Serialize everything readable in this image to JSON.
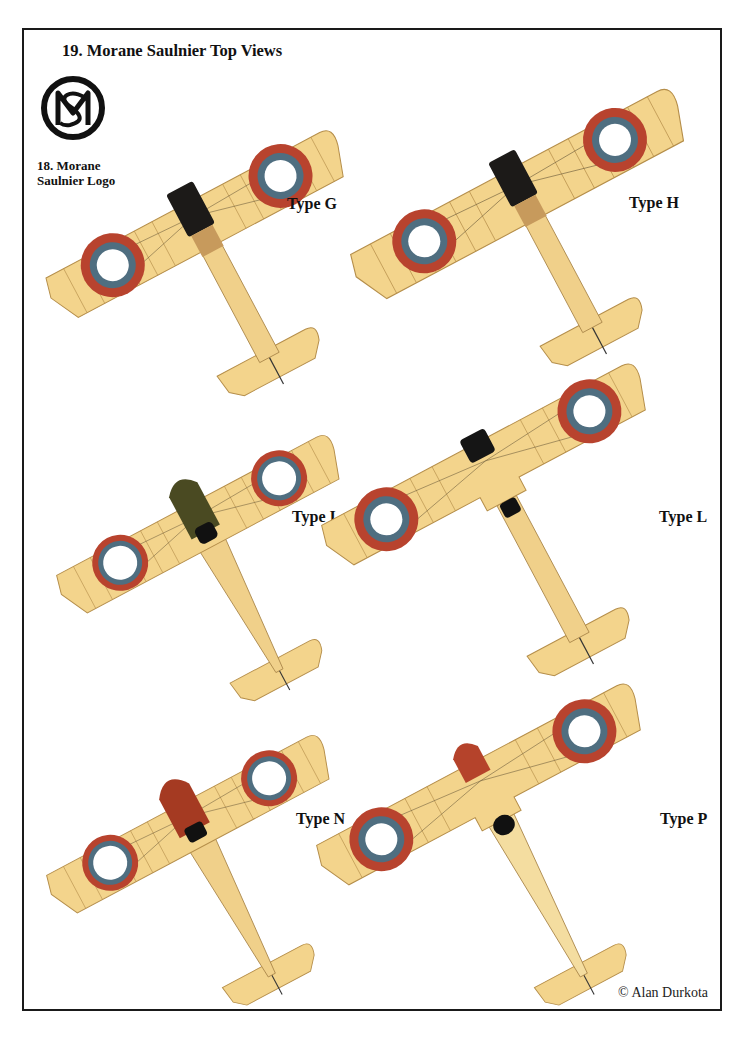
{
  "page_header": "",
  "title": "19. Morane Saulnier Top Views",
  "logo": {
    "icon": "ms-monogram-icon",
    "caption_line1": "18. Morane",
    "caption_line2": "Saulnier Logo"
  },
  "colors": {
    "wing": "#f3d48c",
    "wing_edge": "#b58e4a",
    "roundel_red": "#b8432e",
    "roundel_blue": "#4f6e80",
    "roundel_white": "#ffffff",
    "frame": "#1a1a1a"
  },
  "aircraft": [
    {
      "id": "type-g",
      "label": "Type G",
      "nose_color": "#1c1a18"
    },
    {
      "id": "type-h",
      "label": "Type H",
      "nose_color": "#1c1a18"
    },
    {
      "id": "type-i",
      "label": "Type I",
      "nose_color": "#4a4a22"
    },
    {
      "id": "type-l",
      "label": "Type L",
      "nose_color": "#151515"
    },
    {
      "id": "type-n",
      "label": "Type N",
      "nose_color": "#a53a22"
    },
    {
      "id": "type-p",
      "label": "Type P",
      "nose_color": "#b5432b"
    }
  ],
  "credit": "© Alan Durkota"
}
